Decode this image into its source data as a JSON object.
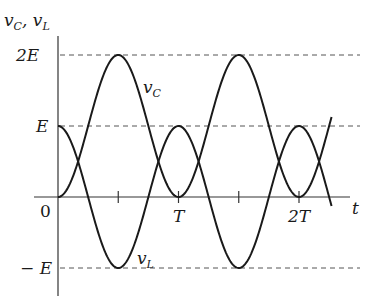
{
  "figure": {
    "y_axis_label": "v_C, v_L",
    "x_axis_label": "t",
    "origin_label": "0",
    "y_ticks": [
      {
        "label": "2E",
        "value": 2
      },
      {
        "label": "E",
        "value": 1
      },
      {
        "label": "− E",
        "value": -1
      }
    ],
    "x_ticks": [
      {
        "label": "",
        "value": 0.5
      },
      {
        "label": "T",
        "value": 1
      },
      {
        "label": "",
        "value": 1.5
      },
      {
        "label": "2T",
        "value": 2
      }
    ],
    "curves": [
      {
        "name": "v_C",
        "label": "v_C",
        "formula": "E(1 - cos(2πt/T))",
        "color": "#1a1a1a"
      },
      {
        "name": "v_L",
        "label": "v_L",
        "formula": "E cos(2πt/T)",
        "color": "#1a1a1a"
      }
    ],
    "t_range": [
      0,
      2.27
    ],
    "dashed_levels": [
      2,
      1,
      -1
    ]
  }
}
